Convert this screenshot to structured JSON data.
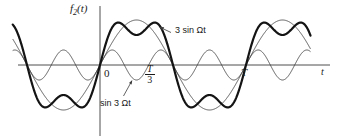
{
  "figure": {
    "type": "line-plot",
    "background": "#ffffff",
    "axis_color": "#3b3b3b",
    "curve_thin_color": "#3b3b3b",
    "curve_bold_color": "#141414",
    "y_axis_label": "f",
    "y_axis_label_sub": "2",
    "y_axis_label_tail": "(t)",
    "x_axis_label": "t",
    "origin_label": "0",
    "tick_T_over_3_num": "T",
    "tick_T_over_3_den": "3",
    "tick_T_label": "T",
    "annotation_fundamental": "3 sin Ωt",
    "annotation_harmonic": "sin 3 Ωt"
  },
  "chart_data": {
    "type": "line",
    "title": "",
    "xlabel": "t",
    "ylabel": "f2(t)",
    "grid": false,
    "legend": "annotations",
    "x_ticks": [
      {
        "value": 0,
        "label": "0"
      },
      {
        "value": 0.3333,
        "label": "T/3"
      },
      {
        "value": 1.0,
        "label": "T"
      }
    ],
    "xlim": [
      -0.6,
      1.44
    ],
    "ylim": [
      -4,
      4
    ],
    "period_T": 1.0,
    "series": [
      {
        "name": "3 sin Ωt",
        "style": "thin",
        "amplitude": 3,
        "frequency_multiple": 1,
        "expression": "3*sin(2*pi*t/T)"
      },
      {
        "name": "sin 3 Ωt",
        "style": "thin",
        "amplitude": 1,
        "frequency_multiple": 3,
        "expression": "sin(3*2*pi*t/T)"
      },
      {
        "name": "f2(t) sum",
        "style": "bold",
        "amplitude": 3.08,
        "frequency_multiple": 1,
        "expression": "3*sin(2*pi*t/T) + sin(3*2*pi*t/T)"
      }
    ],
    "annotations": [
      {
        "text": "3 sin Ωt",
        "target_series": "3 sin Ωt",
        "leader": true
      },
      {
        "text": "sin 3 Ωt",
        "target_series": "sin 3 Ωt",
        "leader": true
      }
    ]
  }
}
